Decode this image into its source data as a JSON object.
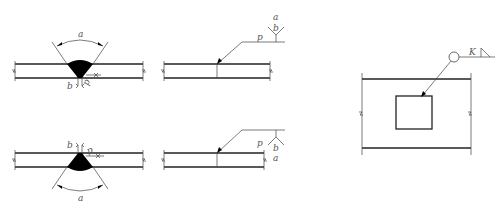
{
  "header_fragment": {
    "left": "— —",
    "right": "————————————"
  },
  "figures": [
    {
      "id": "groove-weld-arrow-side",
      "labels": {
        "angle": "a",
        "gap": "b",
        "root_face": "p"
      }
    },
    {
      "id": "groove-weld-symbol-arrow-side",
      "labels": {
        "root_face": "p",
        "gap": "b",
        "angle": "a"
      }
    },
    {
      "id": "groove-weld-other-side",
      "labels": {
        "angle": "a",
        "gap": "b",
        "root_face": "p"
      }
    },
    {
      "id": "groove-weld-symbol-other-side",
      "labels": {
        "root_face": "p",
        "gap": "b",
        "angle": "a"
      }
    },
    {
      "id": "fillet-weld-all-around",
      "labels": {
        "leg_size": "K"
      }
    }
  ],
  "colors": {
    "line": "#222222",
    "weld_fill": "#000000",
    "text": "#555555",
    "background": "#ffffff"
  }
}
